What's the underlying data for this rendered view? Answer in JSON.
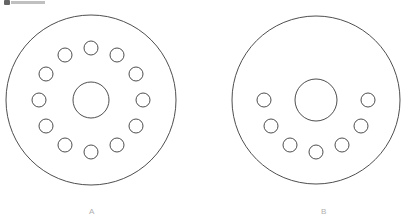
{
  "figure": {
    "background_color": "#ffffff",
    "stroke_color": "#3a3a3a",
    "label_color": "#b0b0b0",
    "width": 413,
    "height": 223
  },
  "parts": [
    {
      "id": "part-a",
      "label": "A",
      "label_x": 92,
      "label_y": 212,
      "center_x": 91,
      "center_y": 100,
      "outer_radius": 85,
      "hub_radius": 18,
      "bolt_circle_radius": 52,
      "hole_radius": 7,
      "hole_count": 12,
      "hole_start_angle_deg": -90,
      "hole_span_deg": 360,
      "pattern": "full-circle",
      "holes": [
        {
          "index": 1,
          "angle_deg": -90,
          "cx": 91,
          "cy": 48
        },
        {
          "index": 2,
          "angle_deg": -60,
          "cx": 117,
          "cy": 55
        },
        {
          "index": 3,
          "angle_deg": -30,
          "cx": 136,
          "cy": 74
        },
        {
          "index": 4,
          "angle_deg": 0,
          "cx": 143,
          "cy": 100
        },
        {
          "index": 5,
          "angle_deg": 30,
          "cx": 136,
          "cy": 126
        },
        {
          "index": 6,
          "angle_deg": 60,
          "cx": 117,
          "cy": 145
        },
        {
          "index": 7,
          "angle_deg": 90,
          "cx": 91,
          "cy": 152
        },
        {
          "index": 8,
          "angle_deg": 120,
          "cx": 65,
          "cy": 145
        },
        {
          "index": 9,
          "angle_deg": 150,
          "cx": 46,
          "cy": 126
        },
        {
          "index": 10,
          "angle_deg": 180,
          "cx": 39,
          "cy": 100
        },
        {
          "index": 11,
          "angle_deg": 210,
          "cx": 46,
          "cy": 74
        },
        {
          "index": 12,
          "angle_deg": 240,
          "cx": 65,
          "cy": 55
        }
      ]
    },
    {
      "id": "part-b",
      "label": "B",
      "label_x": 324,
      "label_y": 212,
      "center_x": 316,
      "center_y": 100,
      "outer_radius": 84,
      "hub_radius": 21,
      "bolt_circle_radius": 52,
      "hole_radius": 7,
      "hole_count": 7,
      "hole_start_angle_deg": 0,
      "hole_span_deg": 180,
      "pattern": "lower-semicircle",
      "holes": [
        {
          "index": 1,
          "angle_deg": 0,
          "cx": 368,
          "cy": 100
        },
        {
          "index": 2,
          "angle_deg": 30,
          "cx": 361,
          "cy": 126
        },
        {
          "index": 3,
          "angle_deg": 60,
          "cx": 342,
          "cy": 145
        },
        {
          "index": 4,
          "angle_deg": 90,
          "cx": 316,
          "cy": 152
        },
        {
          "index": 5,
          "angle_deg": 120,
          "cx": 290,
          "cy": 145
        },
        {
          "index": 6,
          "angle_deg": 150,
          "cx": 271,
          "cy": 126
        },
        {
          "index": 7,
          "angle_deg": 180,
          "cx": 264,
          "cy": 100
        }
      ]
    }
  ],
  "artifact": {
    "name": "cropped-header-fragment",
    "description": "partial glyph clipped at top-left edge"
  }
}
